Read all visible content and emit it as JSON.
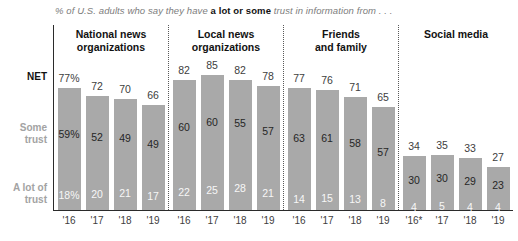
{
  "title": {
    "prefix": "% of U.S. adults who say they have ",
    "emphasis": "a lot or some",
    "suffix": " trust in information from . . ."
  },
  "row_labels": {
    "net": "NET",
    "some": "Some trust",
    "a_lot": "A lot of trust"
  },
  "colors": {
    "bar": "#a9a9a9",
    "net_text": "#404040",
    "some_text": "#262626",
    "a_lot_text": "#f7f7f7",
    "side_label": "#a3a3a3",
    "group_label": "#121212",
    "axis": "#2b2b2b",
    "separator": "#595959",
    "title_gray": "#7d7d7d"
  },
  "chart_data": {
    "type": "bar",
    "stacked": true,
    "title": "% of U.S. adults who say they have a lot or some trust in information from . . .",
    "row_order": [
      "NET",
      "Some trust",
      "A lot of trust"
    ],
    "ylim": [
      0,
      85
    ],
    "grid": false,
    "categories": [
      "'16",
      "'17",
      "'18",
      "'19"
    ],
    "groups": [
      {
        "label_lines": [
          "National news",
          "organizations"
        ],
        "years": [
          "'16",
          "'17",
          "'18",
          "'19"
        ],
        "net": [
          "77%",
          "72",
          "70",
          "66"
        ],
        "some": [
          "59%",
          "52",
          "49",
          "49"
        ],
        "a_lot": [
          "18%",
          "20",
          "21",
          "17"
        ]
      },
      {
        "label_lines": [
          "Local news",
          "organizations"
        ],
        "years": [
          "'16",
          "'17",
          "'18",
          "'19"
        ],
        "net": [
          "82",
          "85",
          "82",
          "78"
        ],
        "some": [
          "60",
          "60",
          "55",
          "57"
        ],
        "a_lot": [
          "22",
          "25",
          "28",
          "21"
        ]
      },
      {
        "label_lines": [
          "Friends",
          "and family"
        ],
        "years": [
          "'16",
          "'17",
          "'18",
          "'19"
        ],
        "net": [
          "77",
          "76",
          "71",
          "65"
        ],
        "some": [
          "63",
          "61",
          "58",
          "57"
        ],
        "a_lot": [
          "14",
          "15",
          "13",
          "8"
        ]
      },
      {
        "label_lines": [
          "Social media"
        ],
        "years": [
          "'16*",
          "'17",
          "'18",
          "'19"
        ],
        "net": [
          "34",
          "35",
          "33",
          "27"
        ],
        "some": [
          "30",
          "30",
          "29",
          "23"
        ],
        "a_lot": [
          "4",
          "5",
          "4",
          "4"
        ]
      }
    ]
  }
}
